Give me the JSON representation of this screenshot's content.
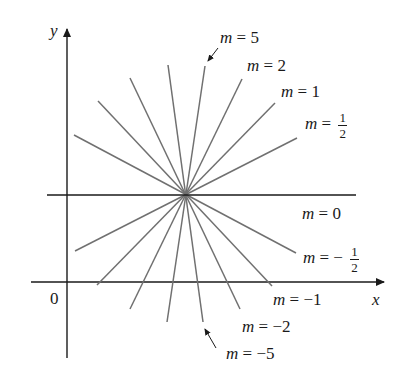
{
  "diagram": {
    "axes": {
      "x_label": "x",
      "y_label": "y",
      "origin_label": "0"
    },
    "center_point": {
      "x": 185,
      "y": 195
    },
    "lines": [
      {
        "slope": "5",
        "label_m": "m",
        "label_eq": "=",
        "label_val": "5"
      },
      {
        "slope": "2",
        "label_m": "m",
        "label_eq": "=",
        "label_val": "2"
      },
      {
        "slope": "1",
        "label_m": "m",
        "label_eq": "=",
        "label_val": "1"
      },
      {
        "slope": "1/2",
        "label_m": "m",
        "label_eq": "=",
        "label_num": "1",
        "label_den": "2"
      },
      {
        "slope": "0",
        "label_m": "m",
        "label_eq": "=",
        "label_val": "0"
      },
      {
        "slope": "-1/2",
        "label_m": "m",
        "label_eq": "= −",
        "label_num": "1",
        "label_den": "2"
      },
      {
        "slope": "-1",
        "label_m": "m",
        "label_eq": "=",
        "label_val": "−1"
      },
      {
        "slope": "-2",
        "label_m": "m",
        "label_eq": "=",
        "label_val": "−2"
      },
      {
        "slope": "-5",
        "label_m": "m",
        "label_eq": "=",
        "label_val": "−5"
      }
    ],
    "colors": {
      "axis": "#1a1a1a",
      "line": "#707070",
      "text": "#1a1a1a"
    }
  }
}
